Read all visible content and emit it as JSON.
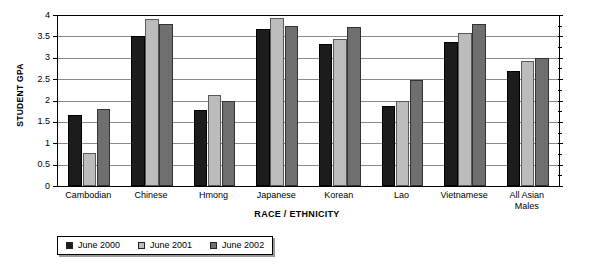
{
  "chart_data": {
    "type": "bar",
    "title": "",
    "xlabel": "RACE / ETHNICITY",
    "ylabel": "STUDENT GPA",
    "ylim": [
      0,
      4
    ],
    "ytick_labels": [
      "0",
      "0.5",
      "1",
      "1.5",
      "2",
      "2.5",
      "3",
      "3.5",
      "4"
    ],
    "ytick_values": [
      0,
      0.5,
      1,
      1.5,
      2,
      2.5,
      3,
      3.5,
      4
    ],
    "grid": "horizontal",
    "legend_position": "bottom-left",
    "categories": [
      "Cambodian",
      "Chinese",
      "Hmong",
      "Japanese",
      "Korean",
      "Lao",
      "Vietnamese",
      "All Asian Males"
    ],
    "category_label_lines": [
      [
        "Cambodian"
      ],
      [
        "Chinese"
      ],
      [
        "Hmong"
      ],
      [
        "Japanese"
      ],
      [
        "Korean"
      ],
      [
        "Lao"
      ],
      [
        "Vietnamese"
      ],
      [
        "All Asian",
        "Males"
      ]
    ],
    "series": [
      {
        "name": "June 2000",
        "color": "#1c1c1c",
        "values": [
          1.67,
          3.52,
          1.78,
          3.67,
          3.32,
          1.87,
          3.38,
          2.7
        ]
      },
      {
        "name": "June 2001",
        "color": "#bcbcbc",
        "values": [
          0.78,
          3.9,
          2.13,
          3.92,
          3.43,
          1.98,
          3.57,
          2.92
        ]
      },
      {
        "name": "June 2002",
        "color": "#6f6f6f",
        "values": [
          1.8,
          3.8,
          1.98,
          3.75,
          3.72,
          2.47,
          3.78,
          3.0
        ]
      }
    ]
  },
  "legend": {
    "items": [
      {
        "label": "June 2000",
        "color": "#1c1c1c"
      },
      {
        "label": "June 2001",
        "color": "#bcbcbc"
      },
      {
        "label": "June 2002",
        "color": "#6f6f6f"
      }
    ]
  }
}
